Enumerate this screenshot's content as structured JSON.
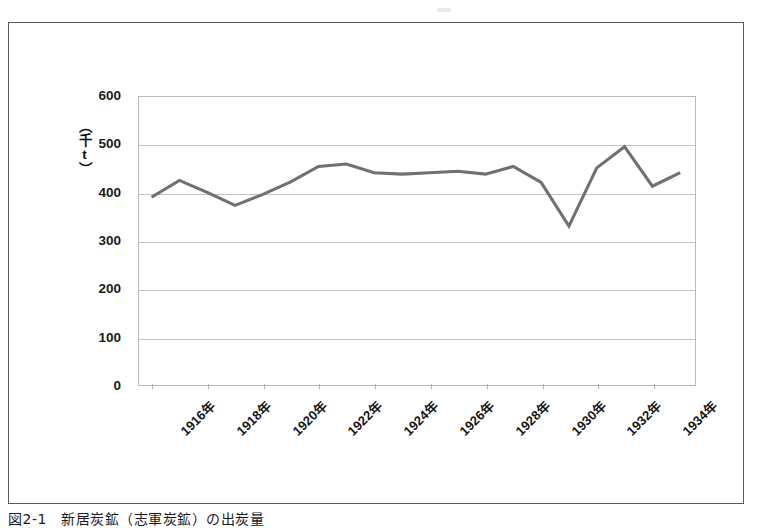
{
  "figure": {
    "caption": "図2-1　新居炭鉱（志軍炭鉱）の出炭量"
  },
  "chart_data": {
    "type": "line",
    "title": "",
    "subtitle": "",
    "xlabel": "",
    "ylabel": "（千t）",
    "ylim": [
      0,
      600
    ],
    "ytick_values": [
      600,
      500,
      400,
      300,
      200,
      100,
      0
    ],
    "ytick_labels": [
      "600",
      "500",
      "400",
      "300",
      "200",
      "100",
      "0"
    ],
    "grid": true,
    "legend": false,
    "legend_position": "none",
    "x": [
      1916,
      1917,
      1918,
      1919,
      1920,
      1921,
      1922,
      1923,
      1924,
      1925,
      1926,
      1927,
      1928,
      1929,
      1930,
      1931,
      1932,
      1933,
      1934,
      1935
    ],
    "xtick_labels": [
      "1916年",
      "1918年",
      "1920年",
      "1922年",
      "1924年",
      "1926年",
      "1928年",
      "1930年",
      "1932年",
      "1934年"
    ],
    "xtick_values": [
      1916,
      1918,
      1920,
      1922,
      1924,
      1926,
      1928,
      1930,
      1932,
      1934
    ],
    "xtick_label_rotation": -45,
    "series": [
      {
        "name": "出炭量",
        "color": "#707070",
        "values": [
          389,
          424,
          399,
          372,
          395,
          421,
          453,
          458,
          440,
          437,
          440,
          443,
          437,
          453,
          420,
          329,
          450,
          494,
          412,
          440
        ]
      }
    ]
  }
}
